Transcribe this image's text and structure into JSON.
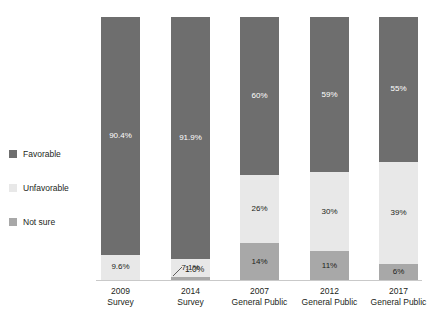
{
  "title_fragment": "",
  "legend": {
    "position": "left",
    "items": [
      {
        "label": "Favorable",
        "color": "#6e6e6e"
      },
      {
        "label": "Unfavorable",
        "color": "#e8e8e8"
      },
      {
        "label": "Not sure",
        "color": "#a8a8a8"
      }
    ]
  },
  "callout": {
    "label": "1.0%",
    "belongs_to": "2014 Survey / Not sure"
  },
  "chart_data": {
    "type": "bar",
    "subtype": "stacked-100-percent",
    "orientation": "vertical",
    "title": "",
    "xlabel": "",
    "ylabel": "",
    "ylim": [
      0,
      100
    ],
    "grid": false,
    "legend_position": "left",
    "categories": [
      "2009 Survey",
      "2014 Survey",
      "2007 General Public",
      "2012 General Public",
      "2017 General Public"
    ],
    "category_lines": [
      [
        "2009",
        "Survey"
      ],
      [
        "2014",
        "Survey"
      ],
      [
        "2007",
        "General Public"
      ],
      [
        "2012",
        "General Public"
      ],
      [
        "2017",
        "General Public"
      ]
    ],
    "series": [
      {
        "name": "Favorable",
        "color": "#6e6e6e",
        "values": [
          90.4,
          91.9,
          60,
          59,
          55
        ],
        "labels": [
          "90.4%",
          "91.9%",
          "60%",
          "59%",
          "55%"
        ]
      },
      {
        "name": "Unfavorable",
        "color": "#e8e8e8",
        "values": [
          9.6,
          7.1,
          26,
          30,
          39
        ],
        "labels": [
          "9.6%",
          "7.1%",
          "26%",
          "30%",
          "39%"
        ]
      },
      {
        "name": "Not sure",
        "color": "#a8a8a8",
        "values": [
          0,
          1.0,
          14,
          11,
          6
        ],
        "labels": [
          "",
          "1.0%",
          "14%",
          "11%",
          "6%"
        ]
      }
    ]
  }
}
